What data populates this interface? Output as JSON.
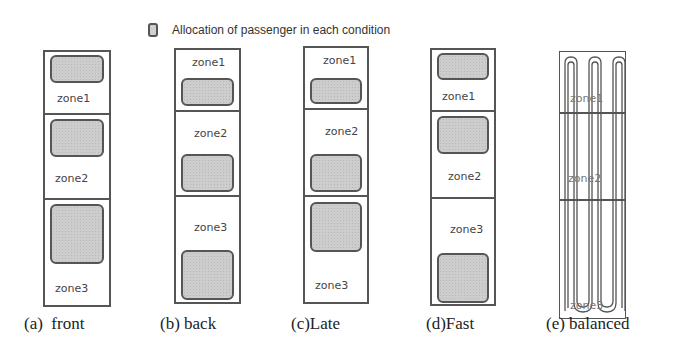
{
  "legend": {
    "icon": "passenger-allocation-swatch",
    "text": "Allocation of passenger in each condition"
  },
  "colors": {
    "block_fill": "#cdcdcd",
    "border": "#555555",
    "text": "#333333"
  },
  "panels": [
    {
      "id": "a",
      "caption": "(a)  front",
      "zones": [
        "zone1",
        "zone2",
        "zone3"
      ],
      "allocation": "top of each zone"
    },
    {
      "id": "b",
      "caption": "(b) back",
      "zones": [
        "zone1",
        "zone2",
        "zone3"
      ],
      "allocation": "bottom of each zone"
    },
    {
      "id": "c",
      "caption": "(c)Late",
      "zones": [
        "zone1",
        "zone2",
        "zone3"
      ],
      "allocation": "bottom of zone1/zone2, top of zone3"
    },
    {
      "id": "d",
      "caption": "(d)Fast",
      "zones": [
        "zone1",
        "zone2",
        "zone3"
      ],
      "allocation": "top of zone1/zone2, bottom of zone3"
    },
    {
      "id": "e",
      "caption": "(e) balanced",
      "zones": [
        "zone1",
        "zone2",
        "zone3"
      ],
      "allocation": "evenly spread serpentine columns"
    }
  ]
}
